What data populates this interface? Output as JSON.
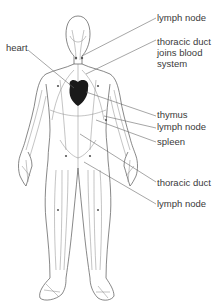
{
  "labels": [
    {
      "id": "lymph-node-neck",
      "text": "lymph node"
    },
    {
      "id": "thoracic-duct-joins",
      "text": "thoracic duct\njoins blood\nsystem"
    },
    {
      "id": "heart",
      "text": "heart"
    },
    {
      "id": "thymus",
      "text": "thymus"
    },
    {
      "id": "lymph-node-arm",
      "text": "lymph node"
    },
    {
      "id": "spleen",
      "text": "spleen"
    },
    {
      "id": "thoracic-duct",
      "text": "thoracic duct"
    },
    {
      "id": "lymph-node-groin",
      "text": "lymph node"
    }
  ],
  "colors": {
    "heart": "#1a1a1a",
    "label_text": "#3a3a3a",
    "leader": "#6a6a6a",
    "line_art": "#666666"
  }
}
